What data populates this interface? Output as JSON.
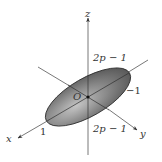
{
  "diagram": {
    "type": "3d-axes-with-ellipse",
    "axes": {
      "x": {
        "label": "x"
      },
      "y": {
        "label": "y"
      },
      "z": {
        "label": "z"
      }
    },
    "origin_label": "O",
    "annotations": {
      "z_positive": "2p − 1",
      "z_negative": "2p − 1",
      "y_extent": "−1",
      "x_extent": "1"
    },
    "colors": {
      "ellipse_fill_dark": "#555555",
      "ellipse_fill_light": "#bdbdbd",
      "ellipse_edge": "#2a2a2a",
      "axis": "#555555",
      "text": "#333333"
    }
  }
}
